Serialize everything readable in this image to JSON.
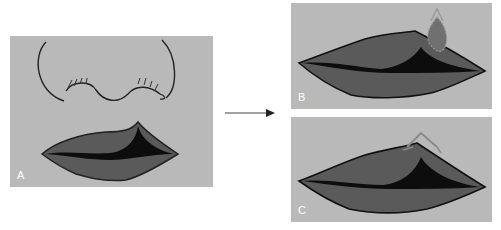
{
  "figure": {
    "panels": [
      {
        "id": "A",
        "label": "A",
        "content": "nose and lips before repair"
      },
      {
        "id": "B",
        "label": "B",
        "content": "lips with outlined peak of upper lip (dashed)"
      },
      {
        "id": "C",
        "label": "C",
        "content": "lips with reconstructed peak outlined"
      }
    ],
    "arrow": {
      "direction": "right"
    },
    "colors": {
      "panel_bg": "#b9b9b9",
      "lip": "#5a5a5a",
      "lip_dark": "#0d0d0d",
      "label": "#ffffff"
    }
  }
}
